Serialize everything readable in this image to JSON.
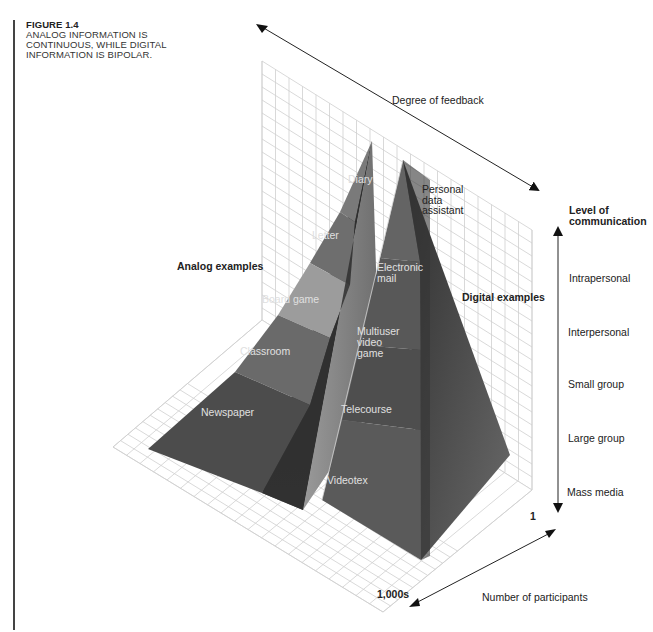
{
  "caption": {
    "figure_label": "FIGURE 1.4",
    "line1": "ANALOG INFORMATION IS",
    "line2": "CONTINUOUS, WHILE DIGITAL",
    "line3": "INFORMATION IS BIPOLAR."
  },
  "axes": {
    "feedback": "Degree of feedback",
    "level_title_1": "Level of",
    "level_title_2": "communication",
    "levels": [
      "Intrapersonal",
      "Interpersonal",
      "Small group",
      "Large group",
      "Mass media"
    ],
    "participants": "Number of participants",
    "participants_min": "1",
    "participants_max": "1,000s"
  },
  "analog": {
    "title": "Analog examples",
    "items": [
      "Diary",
      "Letter",
      "Board game",
      "Classroom",
      "Newspaper"
    ]
  },
  "digital": {
    "title": "Digital examples",
    "pda_1": "Personal",
    "pda_2": "data",
    "pda_3": "assistant",
    "email_1": "Electronic",
    "email_2": "mail",
    "video_1": "Multiuser",
    "video_2": "video",
    "video_3": "game",
    "telecourse": "Telecourse",
    "videotex": "Videotex"
  },
  "footer": "left-clipped body text line",
  "colors": {
    "grid": "#cfcfcf",
    "analog_dark": "#4a4a4a",
    "analog_mid": "#6b6b6b",
    "analog_light": "#9a9a9a",
    "digital_face": "#5e5e5e",
    "digital_side": "#3a3a3a"
  }
}
